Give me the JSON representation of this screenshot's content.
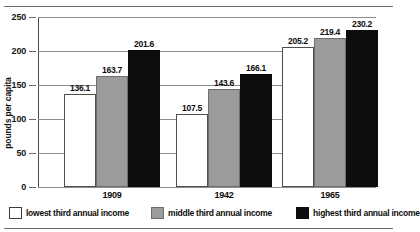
{
  "chart_data": {
    "type": "bar",
    "title": "",
    "xlabel": "",
    "ylabel": "pounds per capita",
    "ylim": [
      0,
      250
    ],
    "yticks": [
      0,
      50,
      100,
      150,
      200,
      250
    ],
    "ytick_labels": [
      "0",
      "50",
      "100",
      "150",
      "200",
      "250"
    ],
    "grid": true,
    "legend_position": "bottom",
    "categories": [
      "1909",
      "1942",
      "1965"
    ],
    "series": [
      {
        "name": "lowest third annual income",
        "color": "#ffffff",
        "values": [
          136.1,
          107.5,
          205.2
        ],
        "value_labels": [
          "136.1",
          "107.5",
          "205.2"
        ]
      },
      {
        "name": "middle third annual income",
        "color": "#9b9b9b",
        "values": [
          163.7,
          143.6,
          219.4
        ],
        "value_labels": [
          "163.7",
          "143.6",
          "219.4"
        ]
      },
      {
        "name": "highest third annual income",
        "color": "#0d0d0d",
        "values": [
          201.6,
          166.1,
          230.2
        ],
        "value_labels": [
          "201.6",
          "166.1",
          "230.2"
        ]
      }
    ]
  },
  "axis": {
    "y_title": "pounds per capita",
    "ticks": [
      {
        "label": "250"
      },
      {
        "label": "200"
      },
      {
        "label": "150"
      },
      {
        "label": "100"
      },
      {
        "label": "50"
      },
      {
        "label": "0"
      }
    ]
  },
  "legend": {
    "items": [
      {
        "label": "lowest third annual income"
      },
      {
        "label": "middle third annual income"
      },
      {
        "label": "highest third annual income"
      }
    ]
  },
  "header": {
    "clipped_caption": ""
  }
}
